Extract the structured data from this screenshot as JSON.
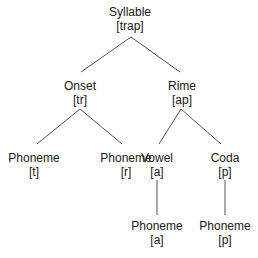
{
  "diagram": {
    "type": "tree",
    "nodes": [
      {
        "id": "syllable",
        "label": "Syllable",
        "value": "[trap]",
        "x": 130,
        "y": 5
      },
      {
        "id": "onset",
        "label": "Onset",
        "value": "[tr]",
        "x": 80,
        "y": 79
      },
      {
        "id": "rime",
        "label": "Rime",
        "value": "[ap]",
        "x": 182,
        "y": 79
      },
      {
        "id": "phoneme-t",
        "label": "Phoneme",
        "value": "[t]",
        "x": 34,
        "y": 151
      },
      {
        "id": "phoneme-r",
        "label": "Phoneme",
        "value": "[r]",
        "x": 126,
        "y": 151
      },
      {
        "id": "vowel",
        "label": "Vowel",
        "value": "[a]",
        "x": 157,
        "y": 151
      },
      {
        "id": "coda",
        "label": "Coda",
        "value": "[p]",
        "x": 225,
        "y": 151
      },
      {
        "id": "phoneme-a",
        "label": "Phoneme",
        "value": "[a]",
        "x": 157,
        "y": 219
      },
      {
        "id": "phoneme-p",
        "label": "Phoneme",
        "value": "[p]",
        "x": 225,
        "y": 219
      }
    ],
    "edges": [
      {
        "from": "syllable",
        "to": "onset",
        "x1": 131,
        "y1": 37,
        "x2": 81,
        "y2": 72
      },
      {
        "from": "syllable",
        "to": "rime",
        "x1": 131,
        "y1": 37,
        "x2": 180,
        "y2": 72
      },
      {
        "from": "onset",
        "to": "phoneme-t",
        "x1": 80,
        "y1": 109,
        "x2": 37,
        "y2": 144
      },
      {
        "from": "onset",
        "to": "phoneme-r",
        "x1": 80,
        "y1": 109,
        "x2": 122,
        "y2": 144
      },
      {
        "from": "rime",
        "to": "vowel",
        "x1": 181,
        "y1": 109,
        "x2": 159,
        "y2": 144
      },
      {
        "from": "rime",
        "to": "coda",
        "x1": 181,
        "y1": 109,
        "x2": 221,
        "y2": 144
      },
      {
        "from": "vowel",
        "to": "phoneme-a",
        "x1": 157,
        "y1": 180,
        "x2": 157,
        "y2": 215
      },
      {
        "from": "coda",
        "to": "phoneme-p",
        "x1": 225,
        "y1": 180,
        "x2": 225,
        "y2": 215
      }
    ]
  }
}
